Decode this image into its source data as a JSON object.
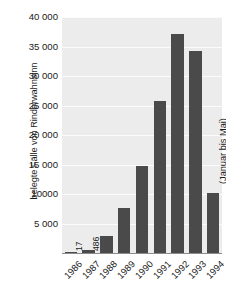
{
  "chart_data": {
    "type": "bar",
    "title": "",
    "subtitle": "",
    "xlabel": "",
    "ylabel": "belegte Fälle von Rinderwahnsinn",
    "categories": [
      "1986",
      "1987",
      "1988",
      "1989",
      "1990",
      "1991",
      "1992",
      "1993",
      "1994"
    ],
    "values": [
      17,
      486,
      2800,
      7600,
      14700,
      25800,
      37100,
      34200,
      10200
    ],
    "ylim": [
      0,
      40000
    ],
    "ytick_values": [
      5000,
      10000,
      15000,
      20000,
      25000,
      30000,
      35000,
      40000
    ],
    "ytick_labels": [
      "5 000",
      "10000",
      "15 000",
      "20 000",
      "25 000",
      "30 000",
      "35 000",
      "40 000"
    ],
    "grid": true,
    "legend": false,
    "legend_position": "none",
    "bar_color": "#4a4a4a",
    "plot_background": "#ececec",
    "gridline_color": "#fbfbfb",
    "axis_color": "#8c8c8c",
    "data_labels": [
      {
        "category": "1986",
        "text": "17"
      },
      {
        "category": "1987",
        "text": "486"
      }
    ],
    "annotations": [
      {
        "category": "1994",
        "text": "(Januar bis Mai)"
      }
    ]
  },
  "axis": {
    "y_title": "belegte Fälle von Rinderwahnsinn"
  }
}
